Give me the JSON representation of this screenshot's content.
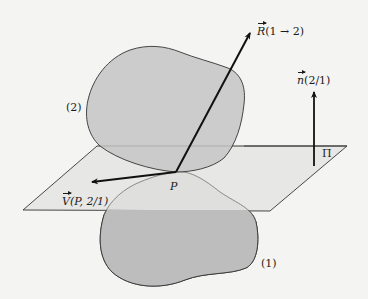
{
  "figure": {
    "colors": {
      "background": "#f4f4f2",
      "body_fill": "#c9c9c9",
      "plane_fill": "#e6e6e4",
      "stroke": "#2a2a2a",
      "arrow": "#111111"
    }
  },
  "labels": {
    "reaction_force": {
      "symbol": "R",
      "args": "(1 → 2)"
    },
    "normal": {
      "symbol": "n",
      "args": "(2/1)"
    },
    "velocity": {
      "symbol": "V",
      "args": "(P, 2/1)"
    },
    "body_2": "(2)",
    "body_1": "(1)",
    "plane": "Π",
    "contact_point": "P"
  }
}
